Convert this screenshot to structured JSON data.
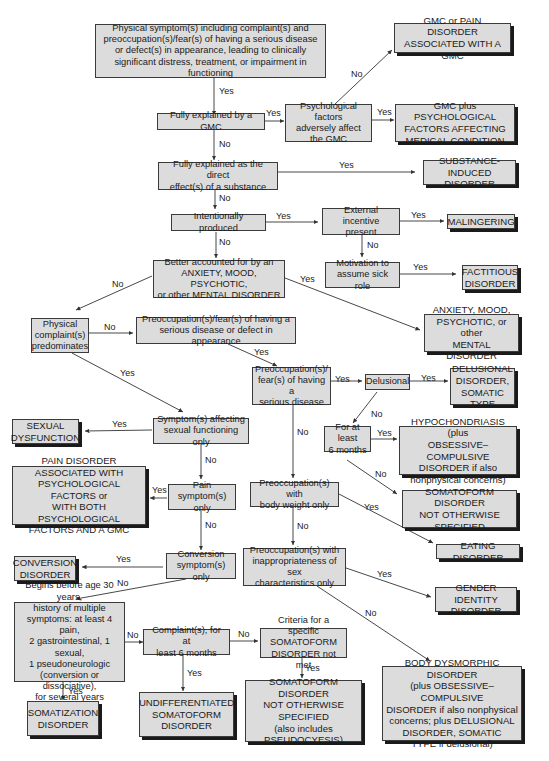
{
  "diagram": {
    "type": "decision-flowchart",
    "nodes": {
      "start": "Physical symptom(s) including complaint(s) and\npreoccupation(s)/fear(s) of having a serious disease\nor defect(s) in appearance, leading to clinically\nsignificant distress, treatment, or impairment in functioning",
      "gmc": "Fully explained by a GMC",
      "psych_factors": "Psychological factors\nadversely affect\nthe GMC",
      "out_gmc_pain": "GMC or PAIN DISORDER\nASSOCIATED WITH A GMC",
      "out_gmc_psych": "GMC plus PSYCHOLOGICAL\nFACTORS AFFECTING\nMEDICAL CONDITION",
      "substance": "Fully explained as the direct\neffect(s) of a substance",
      "out_substance": "SUBSTANCE-\nINDUCED DISORDER",
      "intentional": "Intentionally produced",
      "external": "External incentive\npresent",
      "out_malingering": "MALINGERING",
      "sick_role": "Motivation to\nassume sick role",
      "out_factitious": "FACTITIOUS\nDISORDER",
      "mental": "Better accounted for by an\nANXIETY, MOOD, PSYCHOTIC,\nor other MENTAL DISORDER",
      "out_mental": "ANXIETY, MOOD,\nPSYCHOTIC, or other\nMENTAL DISORDER",
      "physical_pred": "Physical\ncomplaint(s)\npredominates",
      "preocc_disease_defect": "Preoccupation(s)/fear(s) of having a\nserious disease or defect in appearance",
      "preocc_disease": "Preoccupation(s)/\nfear(s) of having a\nserious disease",
      "delusional": "Delusional",
      "out_delusional": "DELUSIONAL\nDISORDER,\nSOMATIC TYPE",
      "six_months_a": "For at least\n6 months",
      "out_hypochondriasis": "HYPOCHONDRIASIS (plus\nOBSESSIVE–COMPULSIVE\nDISORDER if also\nnonphysical concerns)",
      "out_somatoform_nos_a": "SOMATOFORM DISORDER\nNOT OTHERWISE\nSPECIFIED",
      "sexual": "Symptom(s) affecting\nsexual functioning only",
      "out_sexual": "SEXUAL\nDYSFUNCTION",
      "pain": "Pain\nsymptom(s) only",
      "out_pain": "PAIN DISORDER\nASSOCIATED WITH\nPSYCHOLOGICAL FACTORS or\nWITH BOTH PSYCHOLOGICAL\nFACTORS AND A GMC",
      "body_weight": "Preoccupation(s) with\nbody weight only",
      "out_eating": "EATING DISORDER",
      "conversion": "Conversion\nsymptom(s) only",
      "out_conversion": "CONVERSION\nDISORDER",
      "sex_char": "Preoccupation(s) with\ninappropriateness of sex\ncharacteristics only",
      "out_gender": "GENDER IDENTITY\nDISORDER",
      "before30": "Begins before age 30 years,\nhistory of multiple\nsymptoms: at least 4 pain,\n2 gastrointestinal, 1 sexual,\n1 pseudoneurologic\n(conversion or dissociative),\nfor several years",
      "out_somatization": "SOMATIZATION\nDISORDER",
      "complaints_6mo": "Complaint(s), for at\nleast  6 months",
      "out_undiff": "UNDIFFERENTIATED\nSOMATOFORM\nDISORDER",
      "criteria_not_met": "Criteria for a specific\nSOMATOFORM\nDISORDER not met",
      "out_somatoform_nos_b": "SOMATOFORM DISORDER\nNOT OTHERWISE\nSPECIFIED\n(also includes\nPSEUDOCYESIS)",
      "out_bdd": "BODY DYSMORPHIC DISORDER\n(plus OBSESSIVE–COMPULSIVE\nDISORDER if also nonphysical\nconcerns; plus DELUSIONAL\nDISORDER, SOMATIC\nTYPE if delusional)"
    },
    "edge_labels": {
      "yes": "Yes",
      "no": "No"
    },
    "colors": {
      "box_fill": "#dcdcdc",
      "border": "#3a3a3a",
      "shadow": "#1a1a1a",
      "background": "#ffffff"
    }
  }
}
